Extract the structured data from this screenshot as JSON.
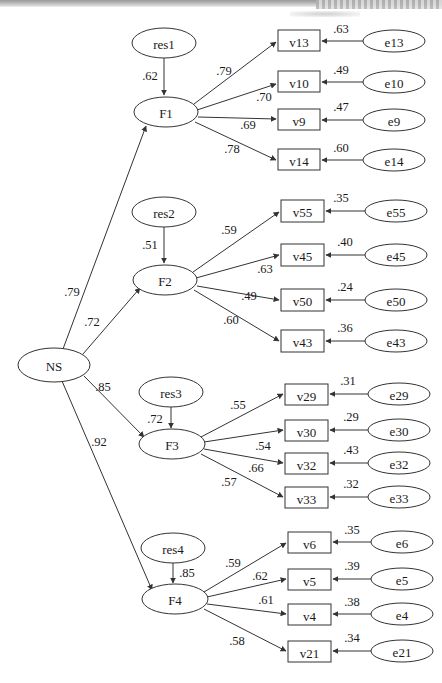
{
  "figure": {
    "type": "sem-path-diagram",
    "second_order_factor": "NS",
    "background_color": "#ffffff",
    "stroke_color": "#333333"
  },
  "nodes": {
    "latent": [
      {
        "id": "NS",
        "label": "NS",
        "shape": "ellipse",
        "cx": 54,
        "cy": 365,
        "rx": 36,
        "ry": 17
      },
      {
        "id": "F1",
        "label": "F1",
        "shape": "ellipse",
        "cx": 166,
        "cy": 112,
        "rx": 32,
        "ry": 15
      },
      {
        "id": "F2",
        "label": "F2",
        "shape": "ellipse",
        "cx": 165,
        "cy": 280,
        "rx": 32,
        "ry": 15
      },
      {
        "id": "F3",
        "label": "F3",
        "shape": "ellipse",
        "cx": 172,
        "cy": 444,
        "rx": 33,
        "ry": 15
      },
      {
        "id": "F4",
        "label": "F4",
        "shape": "ellipse",
        "cx": 175,
        "cy": 599,
        "rx": 33,
        "ry": 15
      }
    ],
    "residuals": [
      {
        "id": "res1",
        "label": "res1",
        "shape": "ellipse",
        "cx": 164,
        "cy": 43,
        "rx": 32,
        "ry": 15
      },
      {
        "id": "res2",
        "label": "res2",
        "shape": "ellipse",
        "cx": 164,
        "cy": 212,
        "rx": 32,
        "ry": 15
      },
      {
        "id": "res3",
        "label": "res3",
        "shape": "ellipse",
        "cx": 171,
        "cy": 392,
        "rx": 32,
        "ry": 15
      },
      {
        "id": "res4",
        "label": "res4",
        "shape": "ellipse",
        "cx": 173,
        "cy": 548,
        "rx": 32,
        "ry": 15
      }
    ],
    "observed": [
      {
        "id": "v13",
        "label": "v13",
        "shape": "rect",
        "x": 278,
        "y": 30,
        "w": 42,
        "h": 21
      },
      {
        "id": "v10",
        "label": "v10",
        "shape": "rect",
        "x": 278,
        "y": 71,
        "w": 42,
        "h": 21
      },
      {
        "id": "v9",
        "label": "v9",
        "shape": "rect",
        "x": 278,
        "y": 109,
        "w": 42,
        "h": 21
      },
      {
        "id": "v14",
        "label": "v14",
        "shape": "rect",
        "x": 278,
        "y": 149,
        "w": 42,
        "h": 21
      },
      {
        "id": "v55",
        "label": "v55",
        "shape": "rect",
        "x": 281,
        "y": 200,
        "w": 43,
        "h": 22
      },
      {
        "id": "v45",
        "label": "v45",
        "shape": "rect",
        "x": 281,
        "y": 244,
        "w": 43,
        "h": 22
      },
      {
        "id": "v50",
        "label": "v50",
        "shape": "rect",
        "x": 281,
        "y": 289,
        "w": 43,
        "h": 22
      },
      {
        "id": "v43",
        "label": "v43",
        "shape": "rect",
        "x": 281,
        "y": 330,
        "w": 43,
        "h": 22
      },
      {
        "id": "v29",
        "label": "v29",
        "shape": "rect",
        "x": 285,
        "y": 384,
        "w": 43,
        "h": 21
      },
      {
        "id": "v30",
        "label": "v30",
        "shape": "rect",
        "x": 285,
        "y": 420,
        "w": 43,
        "h": 21
      },
      {
        "id": "v32",
        "label": "v32",
        "shape": "rect",
        "x": 285,
        "y": 453,
        "w": 43,
        "h": 21
      },
      {
        "id": "v33",
        "label": "v33",
        "shape": "rect",
        "x": 285,
        "y": 487,
        "w": 43,
        "h": 21
      },
      {
        "id": "v6",
        "label": "v6",
        "shape": "rect",
        "x": 288,
        "y": 532,
        "w": 43,
        "h": 21
      },
      {
        "id": "v5",
        "label": "v5",
        "shape": "rect",
        "x": 288,
        "y": 569,
        "w": 43,
        "h": 21
      },
      {
        "id": "v4",
        "label": "v4",
        "shape": "rect",
        "x": 288,
        "y": 604,
        "w": 43,
        "h": 21
      },
      {
        "id": "v21",
        "label": "v21",
        "shape": "rect",
        "x": 288,
        "y": 641,
        "w": 43,
        "h": 21
      }
    ],
    "errors": [
      {
        "id": "e13",
        "label": "e13",
        "shape": "ellipse",
        "cx": 394,
        "cy": 41,
        "rx": 31,
        "ry": 11
      },
      {
        "id": "e10",
        "label": "e10",
        "shape": "ellipse",
        "cx": 394,
        "cy": 82,
        "rx": 31,
        "ry": 11
      },
      {
        "id": "e9",
        "label": "e9",
        "shape": "ellipse",
        "cx": 394,
        "cy": 120,
        "rx": 31,
        "ry": 11
      },
      {
        "id": "e14",
        "label": "e14",
        "shape": "ellipse",
        "cx": 394,
        "cy": 160,
        "rx": 31,
        "ry": 11
      },
      {
        "id": "e55",
        "label": "e55",
        "shape": "ellipse",
        "cx": 396,
        "cy": 211,
        "rx": 31,
        "ry": 11
      },
      {
        "id": "e45",
        "label": "e45",
        "shape": "ellipse",
        "cx": 396,
        "cy": 255,
        "rx": 31,
        "ry": 11
      },
      {
        "id": "e50",
        "label": "e50",
        "shape": "ellipse",
        "cx": 396,
        "cy": 300,
        "rx": 31,
        "ry": 11
      },
      {
        "id": "e43",
        "label": "e43",
        "shape": "ellipse",
        "cx": 396,
        "cy": 341,
        "rx": 31,
        "ry": 11
      },
      {
        "id": "e29",
        "label": "e29",
        "shape": "ellipse",
        "cx": 399,
        "cy": 394,
        "rx": 31,
        "ry": 11
      },
      {
        "id": "e30",
        "label": "e30",
        "shape": "ellipse",
        "cx": 399,
        "cy": 430,
        "rx": 31,
        "ry": 11
      },
      {
        "id": "e32",
        "label": "e32",
        "shape": "ellipse",
        "cx": 399,
        "cy": 463,
        "rx": 31,
        "ry": 11
      },
      {
        "id": "e33",
        "label": "e33",
        "shape": "ellipse",
        "cx": 399,
        "cy": 497,
        "rx": 31,
        "ry": 11
      },
      {
        "id": "e6",
        "label": "e6",
        "shape": "ellipse",
        "cx": 402,
        "cy": 542,
        "rx": 31,
        "ry": 11
      },
      {
        "id": "e5",
        "label": "e5",
        "shape": "ellipse",
        "cx": 402,
        "cy": 579,
        "rx": 31,
        "ry": 11
      },
      {
        "id": "e4",
        "label": "e4",
        "shape": "ellipse",
        "cx": 402,
        "cy": 614,
        "rx": 31,
        "ry": 11
      },
      {
        "id": "e21",
        "label": "e21",
        "shape": "ellipse",
        "cx": 402,
        "cy": 651,
        "rx": 31,
        "ry": 11
      }
    ]
  },
  "paths": [
    {
      "from": "NS",
      "to": "F1",
      "coef": ".79",
      "lx": 72,
      "ly": 292,
      "x1": 63,
      "y1": 349,
      "x2": 146,
      "y2": 126
    },
    {
      "from": "NS",
      "to": "F2",
      "coef": ".72",
      "lx": 92,
      "ly": 322,
      "x1": 83,
      "y1": 354,
      "x2": 140,
      "y2": 288
    },
    {
      "from": "NS",
      "to": "F3",
      "coef": ".85",
      "lx": 103,
      "ly": 387,
      "x1": 84,
      "y1": 376,
      "x2": 144,
      "y2": 437
    },
    {
      "from": "NS",
      "to": "F4",
      "coef": ".92",
      "lx": 99,
      "ly": 442,
      "x1": 62,
      "y1": 381,
      "x2": 152,
      "y2": 590
    },
    {
      "from": "res1",
      "to": "F1",
      "coef": ".62",
      "lx": 150,
      "ly": 76,
      "x1": 164,
      "y1": 58,
      "x2": 164,
      "y2": 95
    },
    {
      "from": "res2",
      "to": "F2",
      "coef": ".51",
      "lx": 150,
      "ly": 245,
      "x1": 164,
      "y1": 227,
      "x2": 164,
      "y2": 263
    },
    {
      "from": "res3",
      "to": "F3",
      "coef": ".72",
      "lx": 155,
      "ly": 419,
      "x1": 171,
      "y1": 407,
      "x2": 171,
      "y2": 428
    },
    {
      "from": "res4",
      "to": "F4",
      "coef": ".85",
      "lx": 187,
      "ly": 573,
      "x1": 173,
      "y1": 563,
      "x2": 173,
      "y2": 583
    },
    {
      "from": "F1",
      "to": "v13",
      "coef": ".79",
      "lx": 224,
      "ly": 71,
      "x1": 194,
      "y1": 104,
      "x2": 276,
      "y2": 42
    },
    {
      "from": "F1",
      "to": "v10",
      "coef": ".70",
      "lx": 264,
      "ly": 97,
      "x1": 197,
      "y1": 110,
      "x2": 276,
      "y2": 84
    },
    {
      "from": "F1",
      "to": "v9",
      "coef": ".69",
      "lx": 248,
      "ly": 125,
      "x1": 198,
      "y1": 117,
      "x2": 276,
      "y2": 119
    },
    {
      "from": "F1",
      "to": "v14",
      "coef": ".78",
      "lx": 232,
      "ly": 149,
      "x1": 195,
      "y1": 122,
      "x2": 276,
      "y2": 160
    },
    {
      "from": "F2",
      "to": "v55",
      "coef": ".59",
      "lx": 229,
      "ly": 230,
      "x1": 193,
      "y1": 272,
      "x2": 279,
      "y2": 212
    },
    {
      "from": "F2",
      "to": "v45",
      "coef": ".63",
      "lx": 265,
      "ly": 269,
      "x1": 196,
      "y1": 278,
      "x2": 279,
      "y2": 255
    },
    {
      "from": "F2",
      "to": "v50",
      "coef": ".49",
      "lx": 249,
      "ly": 296,
      "x1": 197,
      "y1": 286,
      "x2": 279,
      "y2": 300
    },
    {
      "from": "F2",
      "to": "v43",
      "coef": ".60",
      "lx": 231,
      "ly": 320,
      "x1": 194,
      "y1": 290,
      "x2": 279,
      "y2": 341
    },
    {
      "from": "F3",
      "to": "v29",
      "coef": ".55",
      "lx": 238,
      "ly": 405,
      "x1": 201,
      "y1": 437,
      "x2": 283,
      "y2": 394
    },
    {
      "from": "F3",
      "to": "v30",
      "coef": ".54",
      "lx": 263,
      "ly": 446,
      "x1": 204,
      "y1": 442,
      "x2": 283,
      "y2": 430
    },
    {
      "from": "F3",
      "to": "v32",
      "coef": ".66",
      "lx": 256,
      "ly": 468,
      "x1": 204,
      "y1": 449,
      "x2": 283,
      "y2": 463
    },
    {
      "from": "F3",
      "to": "v33",
      "coef": ".57",
      "lx": 229,
      "ly": 482,
      "x1": 201,
      "y1": 454,
      "x2": 283,
      "y2": 497
    },
    {
      "from": "F4",
      "to": "v6",
      "coef": ".59",
      "lx": 233,
      "ly": 563,
      "x1": 204,
      "y1": 592,
      "x2": 286,
      "y2": 543
    },
    {
      "from": "F4",
      "to": "v5",
      "coef": ".62",
      "lx": 260,
      "ly": 576,
      "x1": 207,
      "y1": 597,
      "x2": 286,
      "y2": 579
    },
    {
      "from": "F4",
      "to": "v4",
      "coef": ".61",
      "lx": 266,
      "ly": 600,
      "x1": 207,
      "y1": 604,
      "x2": 286,
      "y2": 614
    },
    {
      "from": "F4",
      "to": "v21",
      "coef": ".58",
      "lx": 237,
      "ly": 641,
      "x1": 204,
      "y1": 609,
      "x2": 286,
      "y2": 651
    }
  ],
  "error_paths": [
    {
      "from": "e13",
      "to": "v13",
      "coef": ".63",
      "lx": 341,
      "ly": 29,
      "x1": 363,
      "y1": 41,
      "x2": 322,
      "y2": 41
    },
    {
      "from": "e10",
      "to": "v10",
      "coef": ".49",
      "lx": 341,
      "ly": 70,
      "x1": 363,
      "y1": 82,
      "x2": 322,
      "y2": 82
    },
    {
      "from": "e9",
      "to": "v9",
      "coef": ".47",
      "lx": 341,
      "ly": 107,
      "x1": 363,
      "y1": 120,
      "x2": 322,
      "y2": 120
    },
    {
      "from": "e14",
      "to": "v14",
      "coef": ".60",
      "lx": 341,
      "ly": 148,
      "x1": 363,
      "y1": 160,
      "x2": 322,
      "y2": 160
    },
    {
      "from": "e55",
      "to": "v55",
      "coef": ".35",
      "lx": 341,
      "ly": 198,
      "x1": 365,
      "y1": 211,
      "x2": 326,
      "y2": 211
    },
    {
      "from": "e45",
      "to": "v45",
      "coef": ".40",
      "lx": 345,
      "ly": 242,
      "x1": 365,
      "y1": 255,
      "x2": 326,
      "y2": 255
    },
    {
      "from": "e50",
      "to": "v50",
      "coef": ".24",
      "lx": 345,
      "ly": 287,
      "x1": 365,
      "y1": 300,
      "x2": 326,
      "y2": 300
    },
    {
      "from": "e43",
      "to": "v43",
      "coef": ".36",
      "lx": 345,
      "ly": 328,
      "x1": 365,
      "y1": 341,
      "x2": 326,
      "y2": 341
    },
    {
      "from": "e29",
      "to": "v29",
      "coef": ".31",
      "lx": 348,
      "ly": 381,
      "x1": 368,
      "y1": 394,
      "x2": 330,
      "y2": 394
    },
    {
      "from": "e30",
      "to": "v30",
      "coef": ".29",
      "lx": 351,
      "ly": 417,
      "x1": 368,
      "y1": 430,
      "x2": 330,
      "y2": 430
    },
    {
      "from": "e32",
      "to": "v32",
      "coef": ".43",
      "lx": 351,
      "ly": 450,
      "x1": 368,
      "y1": 463,
      "x2": 330,
      "y2": 463
    },
    {
      "from": "e33",
      "to": "v33",
      "coef": ".32",
      "lx": 351,
      "ly": 484,
      "x1": 368,
      "y1": 497,
      "x2": 330,
      "y2": 497
    },
    {
      "from": "e6",
      "to": "v6",
      "coef": ".35",
      "lx": 352,
      "ly": 530,
      "x1": 371,
      "y1": 542,
      "x2": 333,
      "y2": 542
    },
    {
      "from": "e5",
      "to": "v5",
      "coef": ".39",
      "lx": 352,
      "ly": 566,
      "x1": 371,
      "y1": 579,
      "x2": 333,
      "y2": 579
    },
    {
      "from": "e4",
      "to": "v4",
      "coef": ".38",
      "lx": 352,
      "ly": 602,
      "x1": 371,
      "y1": 614,
      "x2": 333,
      "y2": 614
    },
    {
      "from": "e21",
      "to": "v21",
      "coef": ".34",
      "lx": 352,
      "ly": 638,
      "x1": 371,
      "y1": 651,
      "x2": 333,
      "y2": 651
    }
  ]
}
